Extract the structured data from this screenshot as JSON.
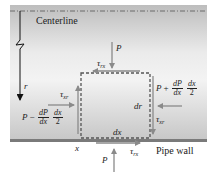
{
  "diagram": {
    "labels": {
      "centerline": "Centerline",
      "pipe_wall": "Pipe wall",
      "r_axis": "r",
      "x_pos": "x",
      "dx": "dx",
      "dr": "dr"
    },
    "forces": {
      "top_pressure": "P",
      "bottom_pressure": "P",
      "tau_symbol": "τ",
      "tau_rx_sub": "rx",
      "tau_xr_sub": "xr",
      "left_pressure": {
        "base": "P",
        "sign": "−",
        "num1": "dP",
        "den1": "dx",
        "num2": "dx",
        "den2": "2"
      },
      "right_pressure": {
        "base": "P",
        "sign": "+",
        "num1": "dP",
        "den1": "dx",
        "num2": "dx",
        "den2": "2"
      }
    },
    "colors": {
      "arrow": "#8a8a8a",
      "axis": "#111111",
      "element_border": "#555555",
      "wall": "#7a7a7a"
    }
  }
}
